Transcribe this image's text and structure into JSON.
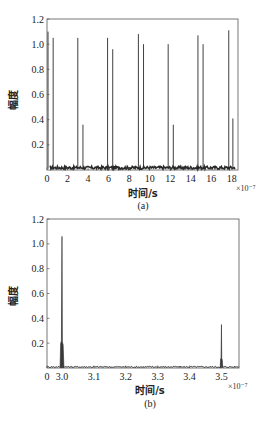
{
  "chart_data": [
    {
      "id": "a",
      "type": "line",
      "caption": "(a)",
      "title": "",
      "xlabel": "时间/s",
      "ylabel": "幅度",
      "x_multiplier": "×10⁻⁷",
      "xlim": [
        0,
        18.6
      ],
      "ylim": [
        0,
        1.2
      ],
      "x_ticks": [
        0,
        2,
        4,
        6,
        8,
        10,
        12,
        14,
        16,
        18
      ],
      "x_tick_labels": [
        "0",
        "2",
        "4",
        "6",
        "8",
        "10",
        "12",
        "14",
        "16",
        "18"
      ],
      "y_ticks": [
        0.2,
        0.4,
        0.6,
        0.8,
        1.0,
        1.2
      ],
      "y_tick_labels": [
        "0.2",
        "0.4",
        "0.6",
        "0.8",
        "1.0",
        "1.2"
      ],
      "grid": false,
      "noise_floor": 0.02,
      "peaks": [
        {
          "x": 0.1,
          "y": 1.1
        },
        {
          "x": 0.6,
          "y": 1.05
        },
        {
          "x": 3.0,
          "y": 1.05
        },
        {
          "x": 3.5,
          "y": 0.36
        },
        {
          "x": 5.9,
          "y": 1.05
        },
        {
          "x": 6.4,
          "y": 0.96
        },
        {
          "x": 8.9,
          "y": 1.08
        },
        {
          "x": 9.4,
          "y": 1.0
        },
        {
          "x": 11.8,
          "y": 1.0
        },
        {
          "x": 12.3,
          "y": 0.36
        },
        {
          "x": 14.7,
          "y": 1.07
        },
        {
          "x": 15.2,
          "y": 1.0
        },
        {
          "x": 17.7,
          "y": 1.11
        },
        {
          "x": 18.1,
          "y": 0.41
        }
      ]
    },
    {
      "id": "b",
      "type": "line",
      "caption": "(b)",
      "title": "",
      "xlabel": "时间/s",
      "ylabel": "幅度",
      "x_multiplier": "×10⁻⁷",
      "xlim": [
        2.953,
        3.555
      ],
      "ylim": [
        0,
        1.2
      ],
      "x_ticks": [
        2.953,
        3.0,
        3.1,
        3.2,
        3.3,
        3.4,
        3.5
      ],
      "x_tick_labels": [
        "0",
        "3.0",
        "3.1",
        "3.2",
        "3.3",
        "3.4",
        "3.5"
      ],
      "y_ticks": [
        0.2,
        0.4,
        0.6,
        0.8,
        1.0,
        1.2
      ],
      "y_tick_labels": [
        "0.2",
        "0.4",
        "0.6",
        "0.8",
        "1.0",
        "1.2"
      ],
      "grid": false,
      "noise_floor": 0.01,
      "peaks": [
        {
          "x": 3.0,
          "y": 1.06,
          "base_width": 0.012,
          "shoulder_y": 0.22
        },
        {
          "x": 3.5,
          "y": 0.35,
          "base_width": 0.008,
          "shoulder_y": 0.08
        }
      ]
    }
  ],
  "colors": {
    "line": "#2a2a2a",
    "frame": "#555555",
    "fill": "#3a3a3a"
  }
}
